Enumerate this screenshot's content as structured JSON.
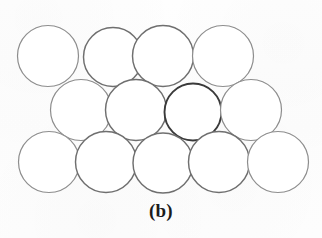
{
  "figure": {
    "caption": "(b)",
    "background_color": "#fdfdfd",
    "width": 322,
    "height": 238
  },
  "style": {
    "circle_fill": "#ffffff",
    "circle_stroke_light": "#8d8d8d",
    "circle_stroke_medium": "#6f6f6f",
    "circle_stroke_dark": "#3a3a3a",
    "stroke_width_light": 1.2,
    "stroke_width_dark": 1.9
  },
  "chart_data": {
    "type": "scatter",
    "title": "(b)",
    "xlabel": "",
    "ylabel": "",
    "xlim": [
      0,
      322
    ],
    "ylim": [
      0,
      238
    ],
    "grid": false,
    "legend": null,
    "circle_radius": 30.5,
    "rows": [
      {
        "name": "top-row",
        "count": 4,
        "center_y": 56,
        "centers_x": [
          48,
          113,
          163,
          223
        ]
      },
      {
        "name": "middle-row",
        "count": 4,
        "center_y": 110,
        "centers_x": [
          81,
          136,
          193,
          251
        ]
      },
      {
        "name": "bottom-row",
        "count": 5,
        "center_y": 162,
        "centers_x": [
          49,
          106,
          163,
          219,
          278
        ]
      }
    ],
    "circles": [
      {
        "id": "c-top-1",
        "row": "top-row",
        "cx": 48,
        "cy": 56,
        "r": 30.5,
        "shade": "light"
      },
      {
        "id": "c-top-2",
        "row": "top-row",
        "cx": 113,
        "cy": 57,
        "r": 29.5,
        "shade": "medium"
      },
      {
        "id": "c-top-3",
        "row": "top-row",
        "cx": 163,
        "cy": 56,
        "r": 30.5,
        "shade": "medium"
      },
      {
        "id": "c-top-4",
        "row": "top-row",
        "cx": 223,
        "cy": 56,
        "r": 30.5,
        "shade": "light"
      },
      {
        "id": "c-mid-1",
        "row": "middle-row",
        "cx": 81,
        "cy": 110,
        "r": 30.5,
        "shade": "light"
      },
      {
        "id": "c-mid-2",
        "row": "middle-row",
        "cx": 136,
        "cy": 110,
        "r": 30.5,
        "shade": "medium"
      },
      {
        "id": "c-mid-3",
        "row": "middle-row",
        "cx": 193,
        "cy": 112,
        "r": 28.5,
        "shade": "dark"
      },
      {
        "id": "c-mid-4",
        "row": "middle-row",
        "cx": 251,
        "cy": 110,
        "r": 30.5,
        "shade": "light"
      },
      {
        "id": "c-bot-1",
        "row": "bottom-row",
        "cx": 49,
        "cy": 162,
        "r": 30.5,
        "shade": "light"
      },
      {
        "id": "c-bot-2",
        "row": "bottom-row",
        "cx": 106,
        "cy": 162,
        "r": 30.5,
        "shade": "medium"
      },
      {
        "id": "c-bot-3",
        "row": "bottom-row",
        "cx": 163,
        "cy": 163,
        "r": 30.0,
        "shade": "medium"
      },
      {
        "id": "c-bot-4",
        "row": "bottom-row",
        "cx": 219,
        "cy": 162,
        "r": 30.5,
        "shade": "medium"
      },
      {
        "id": "c-bot-5",
        "row": "bottom-row",
        "cx": 278,
        "cy": 162,
        "r": 30.5,
        "shade": "light"
      }
    ]
  }
}
